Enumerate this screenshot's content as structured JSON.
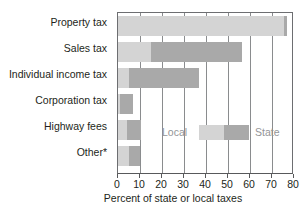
{
  "chart_data": {
    "type": "bar",
    "orientation": "horizontal",
    "stacked": true,
    "title": "",
    "xlabel": "Percent of state or local taxes",
    "ylabel": "",
    "xlim": [
      0,
      80
    ],
    "xticks": [
      0,
      10,
      20,
      30,
      40,
      50,
      60,
      70,
      80
    ],
    "grid": true,
    "grid_axis": "x",
    "legend": {
      "position": "inside-middle-right",
      "entries": [
        {
          "name": "Local",
          "color": "#d4d4d4"
        },
        {
          "name": "State",
          "color": "#a9a9a9"
        }
      ]
    },
    "categories": [
      "Property tax",
      "Sales tax",
      "Individual income tax",
      "Corporation tax",
      "Highway fees",
      "Other*"
    ],
    "series": [
      {
        "name": "Local",
        "color": "#d4d4d4",
        "values": [
          75.5,
          15.0,
          5.0,
          1.0,
          4.0,
          5.0
        ]
      },
      {
        "name": "State",
        "color": "#a9a9a9",
        "values": [
          1.5,
          41.5,
          32.0,
          6.0,
          6.5,
          5.0
        ]
      }
    ],
    "totals": [
      77.0,
      56.5,
      37.0,
      7.0,
      10.5,
      10.0
    ],
    "footnote": "*",
    "colors": {
      "local": "#d4d4d4",
      "state": "#a9a9a9",
      "axis": "#58595b",
      "grid": "#8a8c8e",
      "text": "#231f20",
      "legend_text": "#939598"
    }
  },
  "axis": {
    "x_title": "Percent of state or local taxes"
  }
}
